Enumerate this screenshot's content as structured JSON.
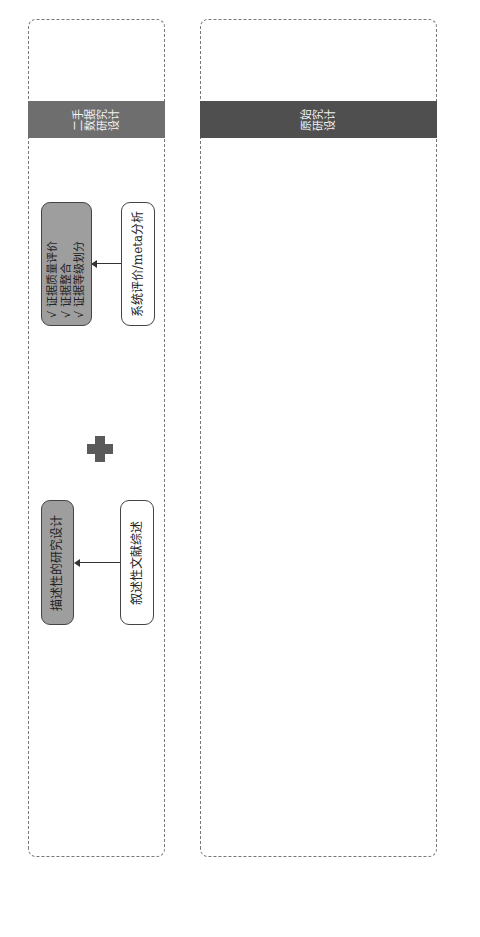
{
  "sections": {
    "secondary": {
      "band_label": "二手\n数据\n研究\n设计",
      "nodes": {
        "systematic_review": "系统评价/meta分析",
        "evidence_box": {
          "items": [
            "√ 证据质量评价",
            "√ 证据整合",
            "√ 证据等级划分"
          ]
        },
        "narrative_review": "叙述性文献综述",
        "descriptive_design": "描述性的研究设计"
      }
    },
    "primary": {
      "band_label": "原始\n研究\n设计",
      "social": {
        "title": "社会适应性研究设计",
        "box": {
          "title": "质性研究",
          "items": [
            "√ 伦理性",
            "√ 公平性",
            "√ 可接受性",
            "√ 可支付性"
          ]
        }
      },
      "economic": {
        "title": "卫生经济学评价设计",
        "types": [
          "基于模型的经济学评价",
          "基于真实世界数据的评价",
          "基于试验的经济学评价"
        ],
        "models_box": {
          "title": "评价模型",
          "items": [
            "√ 决策树模型",
            "√ 马尔科夫模型",
            "√ 离散时间仿真",
            "√ 分区生存模型"
          ]
        },
        "analysis_box": {
          "title": "经济学评价",
          "items": [
            "√ 成本-效果分析",
            "√ 成本-效用分析"
          ]
        }
      },
      "epidemiology": {
        "title": "流行病学研究设计",
        "branch_cannot_control": "评估人员不能控制\n被评估的卫生技术",
        "branch_can_control": "评估人员能控制\n被评估的卫生技术",
        "observational": {
          "title": "观察性评估设计",
          "analytical": {
            "title": "分析性评估设计",
            "items": [
              "√ 队列评估设计",
              "√ 病例对照评估",
              "设计"
            ]
          },
          "descriptive": {
            "title": "描述性评估设计",
            "items": [
              "√ 案例评估设计",
              "√ 横断面评估设计"
            ]
          }
        },
        "quasi": {
          "title": "准实验性评估设计",
          "box": {
            "title": "非随机对照试验评估设计",
            "items": [
              "√ 试验前后比较设计",
              "√ 中断时间序列设计",
              "√ 回归中断设计"
            ]
          }
        },
        "experimental": {
          "title": "实验性评估设计",
          "box": {
            "title": "随机对照试验评估设计",
            "items": [
              "√ 临床随机对照双盲",
              "试验评估设计",
              "√ 社区干预评估设计"
            ]
          }
        }
      }
    }
  },
  "footnote": "注：卫生经济学评价设计会综合采用二手数据研究和原始研究两种设计",
  "icons": {
    "plus": "plus-icon",
    "arrow": "block-arrow-icon"
  },
  "colors": {
    "band_secondary": "#6e6e6e",
    "band_primary": "#4f4f4f",
    "box_fill": "#c9c9c9",
    "pill_fill": "#bdbdbd",
    "plus": "#5a5a5a"
  }
}
